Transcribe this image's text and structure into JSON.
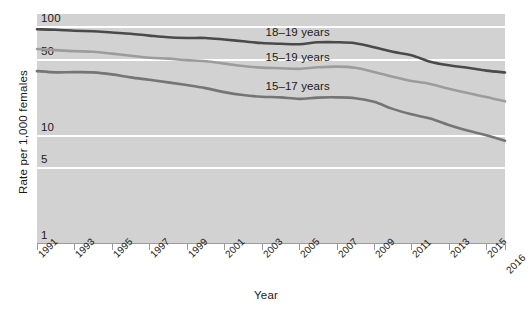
{
  "chart_data": {
    "type": "line",
    "title": "",
    "xlabel": "Year",
    "ylabel": "Rate per 1,000 females",
    "yscale": "log",
    "ylim": [
      1,
      130
    ],
    "ytick_labels": [
      "100",
      "50",
      "10",
      "5",
      "1"
    ],
    "ytick_values": [
      100,
      50,
      10,
      5,
      1
    ],
    "xlim": [
      1991,
      2016
    ],
    "grid": true,
    "legend_position": "inline-annotations",
    "x": [
      1991,
      1992,
      1993,
      1994,
      1995,
      1996,
      1997,
      1998,
      1999,
      2000,
      2001,
      2002,
      2003,
      2004,
      2005,
      2006,
      2007,
      2008,
      2009,
      2010,
      2011,
      2012,
      2013,
      2014,
      2015,
      2016
    ],
    "series": [
      {
        "name": "18–19 years",
        "color": "#4a4a4a",
        "values": [
          94.0,
          93.0,
          91.1,
          90.2,
          87.7,
          85.5,
          82.1,
          79.2,
          78.1,
          78.1,
          75.6,
          72.8,
          70.1,
          69.0,
          68.4,
          71.2,
          71.4,
          69.9,
          64.1,
          58.2,
          54.1,
          47.2,
          43.7,
          41.5,
          39.0,
          37.5
        ]
      },
      {
        "name": "15–19 years",
        "color": "#9c9c9c",
        "values": [
          61.8,
          60.3,
          59.0,
          58.2,
          56.0,
          53.5,
          51.3,
          50.3,
          48.8,
          47.7,
          45.3,
          43.0,
          41.6,
          41.1,
          40.5,
          41.9,
          42.5,
          41.5,
          37.9,
          34.2,
          31.3,
          29.4,
          26.5,
          24.2,
          22.3,
          20.3
        ]
      },
      {
        "name": "15–17 years",
        "color": "#757575",
        "values": [
          38.6,
          37.6,
          37.8,
          37.6,
          36.0,
          33.8,
          32.1,
          30.4,
          28.7,
          26.9,
          24.7,
          23.2,
          22.4,
          22.1,
          21.4,
          22.0,
          22.1,
          21.7,
          20.1,
          17.3,
          15.4,
          14.1,
          12.3,
          10.9,
          9.9,
          8.8
        ]
      }
    ],
    "xtick_labels": [
      "1991",
      "1993",
      "1995",
      "1997",
      "1999",
      "2001",
      "2003",
      "2005",
      "2007",
      "2009",
      "2011",
      "2013",
      "2015",
      "2016"
    ],
    "xtick_values": [
      1991,
      1993,
      1995,
      1997,
      1999,
      2001,
      2003,
      2005,
      2007,
      2009,
      2011,
      2013,
      2015,
      2016
    ]
  },
  "colors": {
    "panel_background": "#d2d2d2",
    "gridline": "#ffffff",
    "axis": "#9b9b9b",
    "text": "#1a1a1a"
  }
}
